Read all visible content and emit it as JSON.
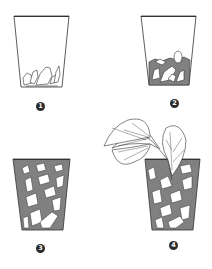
{
  "diagram": {
    "type": "step-by-step illustration",
    "panels": [
      {
        "step": "1",
        "description": "Empty cup with a few stones at bottom"
      },
      {
        "step": "2",
        "description": "Cup with a layer of stones and substrate"
      },
      {
        "step": "3",
        "description": "Cup filled with stones and substrate"
      },
      {
        "step": "4",
        "description": "Filled cup with a leafy plant (begonia) planted"
      }
    ]
  },
  "colors": {
    "line": "#333333",
    "fill_dark": "#6e6e6e",
    "fill_mid": "#9a9a9a",
    "badge": "#2b2b2b",
    "background": "#ffffff"
  }
}
